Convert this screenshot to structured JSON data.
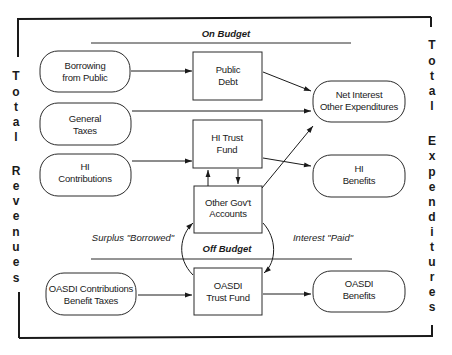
{
  "diagram": {
    "sections": {
      "on_budget": "On Budget",
      "off_budget": "Off Budget"
    },
    "side_labels": {
      "left": {
        "line1": "Total",
        "line2": "Revenues",
        "letters": [
          "T",
          "o",
          "t",
          "a",
          "l",
          "",
          "R",
          "e",
          "v",
          "e",
          "n",
          "u",
          "e",
          "s"
        ]
      },
      "right": {
        "line1": "Total",
        "line2": "Expenditures",
        "letters": [
          "T",
          "o",
          "t",
          "a",
          "l",
          "",
          "E",
          "x",
          "p",
          "e",
          "n",
          "d",
          "i",
          "t",
          "u",
          "r",
          "e",
          "s"
        ]
      }
    },
    "sources": {
      "borrowing": {
        "line1": "Borrowing",
        "line2": "from Public"
      },
      "general_taxes": {
        "line1": "General",
        "line2": "Taxes"
      },
      "hi_contributions": {
        "line1": "HI",
        "line2": "Contributions"
      },
      "oasdi_contributions": {
        "line1": "OASDI Contributions",
        "line2": "Benefit Taxes"
      }
    },
    "accounts": {
      "public_debt": {
        "line1": "Public",
        "line2": "Debt"
      },
      "hi_trust_fund": {
        "line1": "HI Trust",
        "line2": "Fund"
      },
      "other_govt_accounts": {
        "line1": "Other Gov't",
        "line2": "Accounts"
      },
      "oasdi_trust_fund": {
        "line1": "OASDI",
        "line2": "Trust Fund"
      }
    },
    "outlays": {
      "net_interest": {
        "line1": "Net Interest",
        "line2": "Other Expenditures"
      },
      "hi_benefits": {
        "line1": "HI",
        "line2": "Benefits"
      },
      "oasdi_benefits": {
        "line1": "OASDI",
        "line2": "Benefits"
      }
    },
    "flow_labels": {
      "surplus_borrowed": "Surplus \"Borrowed\"",
      "interest_paid": "Interest \"Paid\""
    },
    "colors": {
      "ink": "#1a1a1a",
      "background": "#ffffff"
    }
  }
}
